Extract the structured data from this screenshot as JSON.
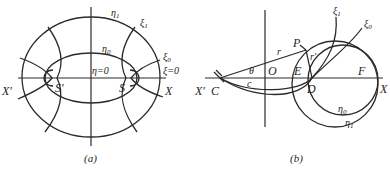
{
  "figure_a": {
    "caption": "(a)",
    "labels": {
      "x_left": "X′",
      "x_right": "X",
      "focus_left": "S′",
      "focus_right": "S",
      "eta1": "η",
      "eta1_sub": "1",
      "eta0": "η",
      "eta0_sub": "0",
      "xi1": "ξ",
      "xi1_sub": "1",
      "xi0": "ξ",
      "xi0_sub": "0",
      "eta_zero": "η=0",
      "xi_zero": "ξ=0"
    }
  },
  "figure_b": {
    "caption": "(b)",
    "labels": {
      "x_left": "X′",
      "c_point": "C",
      "theta": "θ",
      "c_len": "c",
      "origin": "O",
      "r": "r",
      "r_prime": "r′",
      "p_point": "P",
      "e_point": "E",
      "d_point": "D",
      "f_point": "F",
      "x_right": "X",
      "xi1": "ξ",
      "xi1_sub": "1",
      "xi0": "ξ",
      "xi0_sub": "0",
      "eta0": "η",
      "eta0_sub": "0",
      "eta1": "η",
      "eta1_sub": "1"
    }
  }
}
